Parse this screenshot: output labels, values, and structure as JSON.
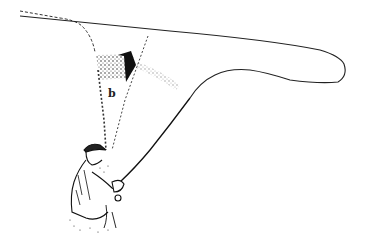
{
  "illustration": {
    "subject": "fly fisherman casting",
    "annotation_letter": "b",
    "colors": {
      "ink": "#1a1a1a",
      "background": "#ffffff"
    }
  }
}
